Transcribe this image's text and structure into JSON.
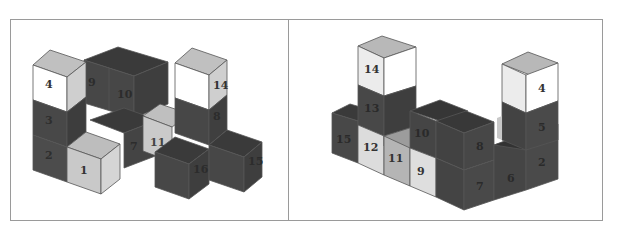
{
  "figure": {
    "panels": [
      {
        "id": "left",
        "description": "Isometric view A of numbered cube structure",
        "labels": [
          "1",
          "2",
          "3",
          "4",
          "9",
          "10",
          "7",
          "11",
          "8",
          "14",
          "16",
          "15"
        ]
      },
      {
        "id": "right",
        "description": "Isometric view B of numbered cube structure",
        "labels": [
          "14",
          "13",
          "15",
          "12",
          "11",
          "10",
          "9",
          "8",
          "7",
          "6",
          "4",
          "5",
          "2"
        ]
      }
    ]
  },
  "colors": {
    "white_face": "#ffffff",
    "light_front": "#c8c8c8",
    "light_top": "#bdbdbd",
    "light_side": "#d8d8d8",
    "dark_front": "#4a4a4a",
    "dark_top": "#3b3b3b",
    "dark_side": "#404040",
    "edge": "#5a5a5a",
    "frame": "#9a9a9a"
  }
}
